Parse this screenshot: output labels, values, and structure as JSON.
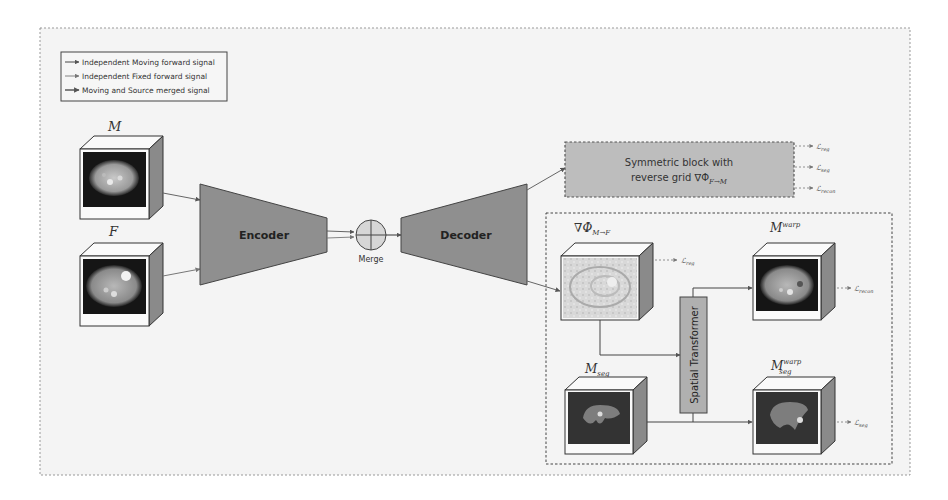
{
  "legend": {
    "items": [
      {
        "label": "Independent Moving forward signal"
      },
      {
        "label": "Independent Fixed forward signal"
      },
      {
        "label": "Moving and Source merged signal"
      }
    ]
  },
  "inputs": {
    "moving": {
      "label": "M"
    },
    "fixed": {
      "label": "F"
    }
  },
  "network": {
    "encoder": "Encoder",
    "decoder": "Decoder",
    "merge": "Merge"
  },
  "symmetric_block": {
    "line1": "Symmetric block with",
    "line2_prefix": "reverse grid ∇Φ",
    "line2_sub": "F→M",
    "losses": [
      {
        "main": "ℒ",
        "sub": "reg"
      },
      {
        "main": "ℒ",
        "sub": "seg"
      },
      {
        "main": "ℒ",
        "sub": "recon"
      }
    ]
  },
  "detail": {
    "deformation": {
      "main": "∇Φ",
      "sub": "M→F",
      "loss_main": "ℒ",
      "loss_sub": "reg"
    },
    "warped": {
      "main": "M",
      "sup": "warp",
      "loss_main": "ℒ",
      "loss_sub": "recon"
    },
    "seg": {
      "main": "M",
      "sub": "seg"
    },
    "warped_seg": {
      "main": "M",
      "sup": "warp",
      "sub": "seg",
      "loss_main": "ℒ",
      "loss_sub": "seg"
    },
    "spatial_transformer": "Spatial Transformer"
  },
  "colors": {
    "block_fill": "#8f8f8f",
    "symmetric_fill": "#bdbdbd",
    "spatial_fill": "#b0b0b0",
    "merge_fill": "#d6d6d6",
    "bg": "#f4f4f4"
  }
}
